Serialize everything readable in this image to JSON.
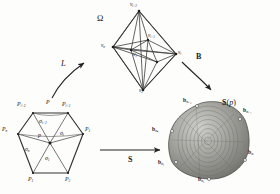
{
  "figure": {
    "background": "#fdfdfb",
    "ink": "#1a1a1a"
  },
  "panels": {
    "fan": {
      "name": "hexagonal fan complex",
      "center_point_label": "p",
      "apex_label": "P",
      "vertices": [
        {
          "id": "Pn",
          "label_base": "P",
          "label_sub": "n",
          "x": 9,
          "y": 132
        },
        {
          "id": "Pi2",
          "label_base": "P",
          "label_sub": "i+2",
          "x": 24,
          "y": 109
        },
        {
          "id": "Pi1",
          "label_base": "P",
          "label_sub": "i+1",
          "x": 71,
          "y": 109
        },
        {
          "id": "P1",
          "label_base": "P",
          "label_sub": "1",
          "x": 88,
          "y": 132
        },
        {
          "id": "P2",
          "label_base": "P",
          "label_sub": "2",
          "x": 72,
          "y": 178
        },
        {
          "id": "P1b",
          "label_base": "P",
          "label_sub": "1",
          "x": 28,
          "y": 178
        }
      ],
      "sectors": [
        {
          "id": "sigma_i1",
          "label_base": "σ",
          "label_sub": "i+1",
          "x": 43,
          "y": 124
        },
        {
          "id": "sigma_i",
          "label_base": "σ",
          "label_sub": "i",
          "x": 62,
          "y": 137
        },
        {
          "id": "sigma_n",
          "label_base": "σ",
          "label_sub": "n",
          "x": 28,
          "y": 152
        },
        {
          "id": "sigma_1",
          "label_base": "σ",
          "label_sub": "1",
          "x": 47,
          "y": 160
        }
      ]
    },
    "graph": {
      "name": "octahedral polytope graph",
      "symbol": "Ω",
      "vertices": [
        {
          "id": "vtop",
          "label_base": "v",
          "label_sub": "i+2",
          "x": 131,
          "y": 4
        },
        {
          "id": "vmid",
          "label_base": "v",
          "label_sub": "i+1",
          "x": 150,
          "y": 32
        },
        {
          "id": "vleft",
          "label_base": "v",
          "label_sub": "n",
          "x": 105,
          "y": 47
        },
        {
          "id": "vin",
          "label_base": "v",
          "label_sub": "1",
          "x": 142,
          "y": 58
        },
        {
          "id": "vright",
          "label_base": "v",
          "label_sub": "i",
          "x": 177,
          "y": 48
        },
        {
          "id": "vbot",
          "label_base": "v",
          "label_sub": "2",
          "x": 142,
          "y": 84
        }
      ]
    },
    "body": {
      "name": "support body",
      "symbol_prefix": "S",
      "symbol_arg": "p",
      "vertices": [
        {
          "id": "bi2",
          "label_base": "b",
          "label_sub": "σᵢ₊₂",
          "x": 191,
          "y": 103
        },
        {
          "id": "bi1",
          "label_base": "b",
          "label_sub": "σᵢ₊₁",
          "x": 245,
          "y": 112
        },
        {
          "id": "bn",
          "label_base": "b",
          "label_sub": "σₙ",
          "x": 161,
          "y": 131
        },
        {
          "id": "bi",
          "label_base": "b",
          "label_sub": "σᵢ",
          "x": 250,
          "y": 154
        },
        {
          "id": "b1",
          "label_base": "b",
          "label_sub": "σ₁",
          "x": 167,
          "y": 163
        },
        {
          "id": "b2",
          "label_base": "b",
          "label_sub": "σ₂",
          "x": 206,
          "y": 177
        }
      ]
    }
  },
  "arrows": [
    {
      "id": "L",
      "label": "L",
      "bold": false,
      "italic": true,
      "x": 64,
      "y": 64
    },
    {
      "id": "B",
      "label": "B",
      "bold": true,
      "italic": false,
      "x": 198,
      "y": 58
    },
    {
      "id": "S",
      "label": "S",
      "bold": true,
      "italic": false,
      "x": 131,
      "y": 161
    }
  ]
}
